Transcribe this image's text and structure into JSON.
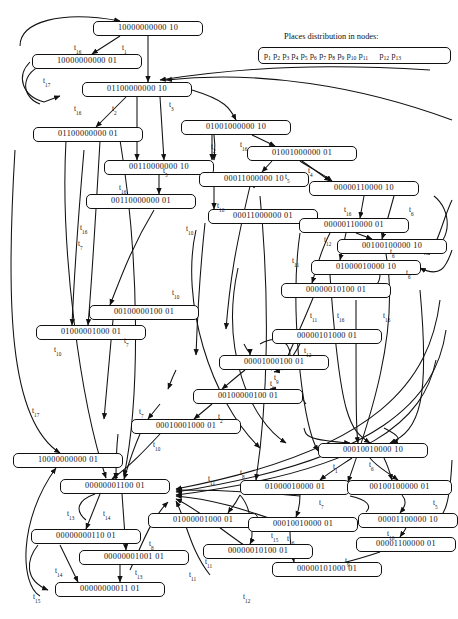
{
  "figure": {
    "type": "reachability-graph",
    "legend_title": "Places distribution in nodes:",
    "legend_places": [
      "p1",
      "p2",
      "p3",
      "p4",
      "p5",
      "p6",
      "p7",
      "p8",
      "p9",
      "p10",
      "p11",
      "p12",
      "p13"
    ],
    "legend_gap_after_index": 10
  },
  "nodes": [
    {
      "id": "n1",
      "label": "10000000000 10",
      "x": 93,
      "y": 21,
      "w": 110
    },
    {
      "id": "n2",
      "label": "10000000000 01",
      "x": 32,
      "y": 54,
      "w": 110
    },
    {
      "id": "n3",
      "label": "01100000000 10",
      "x": 82,
      "y": 82,
      "w": 110
    },
    {
      "id": "n4",
      "label": "01100000000 01",
      "x": 33,
      "y": 127,
      "w": 110
    },
    {
      "id": "n5",
      "label": "01001000000 10",
      "x": 181,
      "y": 120,
      "w": 110
    },
    {
      "id": "n6",
      "label": "01001000000 01",
      "x": 247,
      "y": 146,
      "w": 110
    },
    {
      "id": "n7",
      "label": "00110000000 10",
      "x": 104,
      "y": 160,
      "w": 110
    },
    {
      "id": "n8",
      "label": "00011000000 10",
      "x": 199,
      "y": 172,
      "w": 110
    },
    {
      "id": "n9",
      "label": "00110000000 01",
      "x": 86,
      "y": 194,
      "w": 110
    },
    {
      "id": "n10",
      "label": "00000110000 10",
      "x": 309,
      "y": 181,
      "w": 110
    },
    {
      "id": "n11",
      "label": "00011000000 01",
      "x": 208,
      "y": 209,
      "w": 110
    },
    {
      "id": "n12",
      "label": "00000110000 01",
      "x": 299,
      "y": 218,
      "w": 110
    },
    {
      "id": "n13",
      "label": "00100100000 10",
      "x": 337,
      "y": 239,
      "w": 110
    },
    {
      "id": "n14",
      "label": "01000010000 10",
      "x": 311,
      "y": 260,
      "w": 110
    },
    {
      "id": "n15",
      "label": "00000010100 01",
      "x": 281,
      "y": 283,
      "w": 110
    },
    {
      "id": "n16",
      "label": "00100000100 01",
      "x": 89,
      "y": 305,
      "w": 110
    },
    {
      "id": "n17",
      "label": "01000001000 01",
      "x": 36,
      "y": 325,
      "w": 110
    },
    {
      "id": "n18",
      "label": "00000101000 01",
      "x": 272,
      "y": 329,
      "w": 110
    },
    {
      "id": "n19",
      "label": "00001000100 01",
      "x": 219,
      "y": 355,
      "w": 110
    },
    {
      "id": "n20",
      "label": "00100000100 01",
      "x": 193,
      "y": 389,
      "w": 110
    },
    {
      "id": "n21",
      "label": "00010001000 01",
      "x": 131,
      "y": 419,
      "w": 110
    },
    {
      "id": "n22",
      "label": "00010010000 10",
      "x": 318,
      "y": 443,
      "w": 110
    },
    {
      "id": "n23",
      "label": "10000000000 01",
      "x": 13,
      "y": 453,
      "w": 110
    },
    {
      "id": "n24",
      "label": "01000010000 01",
      "x": 240,
      "y": 480,
      "w": 110
    },
    {
      "id": "n25",
      "label": "00100100000 01",
      "x": 347,
      "y": 480,
      "w": 105
    },
    {
      "id": "n26",
      "label": "00000001100 01",
      "x": 60,
      "y": 479,
      "w": 110
    },
    {
      "id": "n27",
      "label": "01000001000 01",
      "x": 148,
      "y": 513,
      "w": 110
    },
    {
      "id": "n28",
      "label": "00010010000 01",
      "x": 248,
      "y": 517,
      "w": 110
    },
    {
      "id": "n29",
      "label": "00001100000 10",
      "x": 358,
      "y": 513,
      "w": 100
    },
    {
      "id": "n30",
      "label": "00000000110 01",
      "x": 31,
      "y": 529,
      "w": 110
    },
    {
      "id": "n31",
      "label": "00000010100 01",
      "x": 203,
      "y": 544,
      "w": 110
    },
    {
      "id": "n32",
      "label": "00001100000 01",
      "x": 356,
      "y": 537,
      "w": 100
    },
    {
      "id": "n33",
      "label": "00000001001 01",
      "x": 79,
      "y": 550,
      "w": 110
    },
    {
      "id": "n34",
      "label": "00000101000 01",
      "x": 272,
      "y": 562,
      "w": 110
    },
    {
      "id": "n35",
      "label": "00000000011 01",
      "x": 55,
      "y": 582,
      "w": 110
    }
  ],
  "transition_labels": [
    {
      "t": "t16",
      "x": 74,
      "y": 43
    },
    {
      "t": "t1",
      "x": 122,
      "y": 43
    },
    {
      "t": "t17",
      "x": 43,
      "y": 76
    },
    {
      "t": "t16",
      "x": 74,
      "y": 104
    },
    {
      "t": "t2",
      "x": 112,
      "y": 104
    },
    {
      "t": "t3",
      "x": 169,
      "y": 100
    },
    {
      "t": "t2",
      "x": 211,
      "y": 142
    },
    {
      "t": "t16",
      "x": 240,
      "y": 140
    },
    {
      "t": "t5",
      "x": 163,
      "y": 166
    },
    {
      "t": "t16",
      "x": 119,
      "y": 183
    },
    {
      "t": "t5",
      "x": 285,
      "y": 172
    },
    {
      "t": "t4",
      "x": 308,
      "y": 166
    },
    {
      "t": "t16",
      "x": 217,
      "y": 201
    },
    {
      "t": "t16",
      "x": 344,
      "y": 205
    },
    {
      "t": "t6",
      "x": 409,
      "y": 205
    },
    {
      "t": "t12",
      "x": 324,
      "y": 235
    },
    {
      "t": "t6",
      "x": 390,
      "y": 247
    },
    {
      "t": "t6",
      "x": 406,
      "y": 268
    },
    {
      "t": "t11",
      "x": 292,
      "y": 256
    },
    {
      "t": "t10",
      "x": 186,
      "y": 224
    },
    {
      "t": "t10",
      "x": 172,
      "y": 288
    },
    {
      "t": "t11",
      "x": 310,
      "y": 311
    },
    {
      "t": "t16",
      "x": 337,
      "y": 311
    },
    {
      "t": "t16",
      "x": 383,
      "y": 311
    },
    {
      "t": "t7",
      "x": 78,
      "y": 239
    },
    {
      "t": "t16",
      "x": 80,
      "y": 223
    },
    {
      "t": "t7",
      "x": 124,
      "y": 336
    },
    {
      "t": "t10",
      "x": 54,
      "y": 345
    },
    {
      "t": "t12",
      "x": 304,
      "y": 346
    },
    {
      "t": "t9",
      "x": 274,
      "y": 373
    },
    {
      "t": "t6",
      "x": 270,
      "y": 379
    },
    {
      "t": "t7",
      "x": 139,
      "y": 407
    },
    {
      "t": "t2",
      "x": 218,
      "y": 412
    },
    {
      "t": "t17",
      "x": 32,
      "y": 406
    },
    {
      "t": "t10",
      "x": 153,
      "y": 440
    },
    {
      "t": "t1",
      "x": 333,
      "y": 462
    },
    {
      "t": "t6",
      "x": 369,
      "y": 460
    },
    {
      "t": "t11",
      "x": 208,
      "y": 474
    },
    {
      "t": "t7",
      "x": 319,
      "y": 498
    },
    {
      "t": "t5",
      "x": 433,
      "y": 498
    },
    {
      "t": "t13",
      "x": 67,
      "y": 509
    },
    {
      "t": "t14",
      "x": 103,
      "y": 509
    },
    {
      "t": "t8",
      "x": 149,
      "y": 539
    },
    {
      "t": "t16",
      "x": 287,
      "y": 534
    },
    {
      "t": "t15",
      "x": 271,
      "y": 531
    },
    {
      "t": "t16",
      "x": 387,
      "y": 529
    },
    {
      "t": "t14",
      "x": 55,
      "y": 566
    },
    {
      "t": "t13",
      "x": 135,
      "y": 568
    },
    {
      "t": "t11",
      "x": 189,
      "y": 570
    },
    {
      "t": "t9",
      "x": 345,
      "y": 556
    },
    {
      "t": "t15",
      "x": 33,
      "y": 592
    },
    {
      "t": "t12",
      "x": 243,
      "y": 592
    },
    {
      "t": "t11",
      "x": 205,
      "y": 557
    },
    {
      "t": "t8",
      "x": 240,
      "y": 468
    }
  ]
}
